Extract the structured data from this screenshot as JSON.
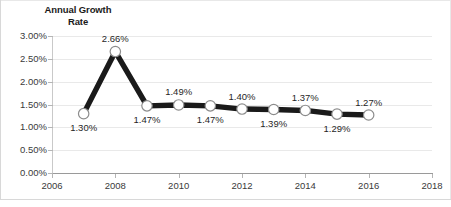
{
  "chart_data": {
    "type": "line",
    "title": "Annual Growth Rate",
    "title_lines": [
      "Annual Growth",
      "Rate"
    ],
    "xlabel": "",
    "ylabel": "",
    "x": [
      2007,
      2008,
      2009,
      2010,
      2011,
      2012,
      2013,
      2014,
      2015,
      2016
    ],
    "values": [
      1.3,
      2.66,
      1.47,
      1.49,
      1.47,
      1.4,
      1.39,
      1.37,
      1.29,
      1.27
    ],
    "point_labels": [
      "1.30%",
      "2.66%",
      "1.47%",
      "1.49%",
      "1.47%",
      "1.40%",
      "1.39%",
      "1.37%",
      "1.29%",
      "1.27%"
    ],
    "label_positions": [
      "below",
      "above",
      "below",
      "above",
      "below",
      "above",
      "below",
      "above",
      "below",
      "above"
    ],
    "xlim": [
      2006,
      2018
    ],
    "ylim": [
      0.0,
      3.0
    ],
    "xticks": [
      2006,
      2008,
      2010,
      2012,
      2014,
      2016,
      2018
    ],
    "xtick_labels": [
      "2006",
      "2008",
      "2010",
      "2012",
      "2014",
      "2016",
      "2018"
    ],
    "yticks": [
      0.0,
      0.5,
      1.0,
      1.5,
      2.0,
      2.5,
      3.0
    ],
    "ytick_labels": [
      "0.00%",
      "0.50%",
      "1.00%",
      "1.50%",
      "2.00%",
      "2.50%",
      "3.00%"
    ],
    "grid": true,
    "grid_axis": "y",
    "legend": false,
    "series_color": "#1a1a1a",
    "marker_fill": "#ffffff",
    "marker_edge": "#8c8c8c",
    "grid_color": "#e9e9e9",
    "axis_color": "#9a9a9a",
    "text_color": "#3a3a3a",
    "background": "#ffffff"
  }
}
